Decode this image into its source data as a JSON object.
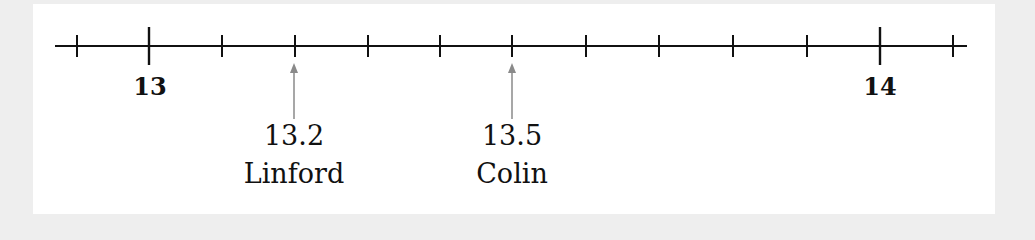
{
  "number_line": {
    "min_label": "13",
    "max_label": "14",
    "tick_interval": 0.1,
    "range": [
      12.9,
      14.1
    ],
    "markers": [
      {
        "value": "13.2",
        "name": "Linford"
      },
      {
        "value": "13.5",
        "name": "Colin"
      }
    ]
  },
  "colors": {
    "line": "#111111",
    "arrow": "#8a8a8a",
    "panel": "#ffffff",
    "background": "#eeeeee"
  }
}
